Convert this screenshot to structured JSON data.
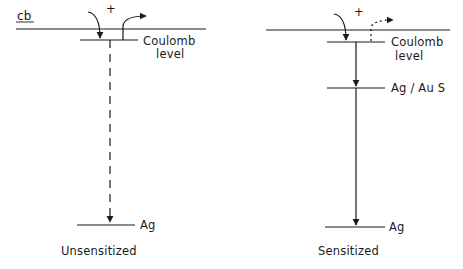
{
  "diagram": {
    "left_panel": {
      "caption": "Unsensitized",
      "band_label": "cb",
      "charge_symbol": "+",
      "coulomb_label_line1": "Coulomb",
      "coulomb_label_line2": "level",
      "ag_label": "Ag",
      "transition_style": "dashed"
    },
    "right_panel": {
      "caption": "Sensitized",
      "charge_symbol": "+",
      "coulomb_label_line1": "Coulomb",
      "coulomb_label_line2": "level",
      "sensitizer_label": "Ag / Au S",
      "ag_label": "Ag",
      "transition_style": "solid"
    },
    "colors": {
      "ink": "#1a1a1a",
      "background": "#ffffff"
    }
  }
}
